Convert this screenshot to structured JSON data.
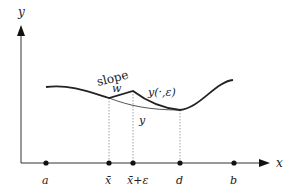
{
  "axes": {
    "x_label": "x",
    "y_label": "y"
  },
  "points": [
    {
      "label": "a",
      "x": 46
    },
    {
      "label": "x̄",
      "x": 109
    },
    {
      "label": "x̄+ε",
      "x": 133
    },
    {
      "label": "d",
      "x": 180
    },
    {
      "label": "b",
      "x": 234
    }
  ],
  "annotations": {
    "slope_word": "slope",
    "slope_var": "w",
    "perturbed_curve": "y(·,ε)",
    "base_curve": "y"
  },
  "colors": {
    "line": "#222222",
    "thin_curve": "#555555",
    "dotted": "#888888"
  }
}
